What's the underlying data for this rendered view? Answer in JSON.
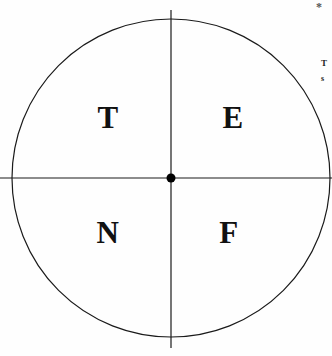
{
  "figure": {
    "name": "circle-quadrant-diagram",
    "background_color": "#fefefe",
    "stroke_color": "#1a1a1a",
    "text_color": "#111111"
  },
  "diagram": {
    "type": "quadrant-circle",
    "circle": {
      "center_x": 171,
      "center_y": 178,
      "radius": 159,
      "stroke_width": 1.2
    },
    "center_dot": {
      "radius": 4.5,
      "fill": "#000000"
    },
    "vertical_axis": {
      "x": 171,
      "y_start": 10,
      "y_end": 348
    },
    "horizontal_axis": {
      "y": 178,
      "x_start": 0,
      "x_end": 332
    },
    "quadrants": [
      {
        "position": "top-left",
        "label": "T"
      },
      {
        "position": "top-right",
        "label": "E"
      },
      {
        "position": "bottom-left",
        "label": "N"
      },
      {
        "position": "bottom-right",
        "label": "F"
      }
    ]
  },
  "margin": {
    "asterisk": "*",
    "note_line_1": "T",
    "note_line_2": "s"
  }
}
